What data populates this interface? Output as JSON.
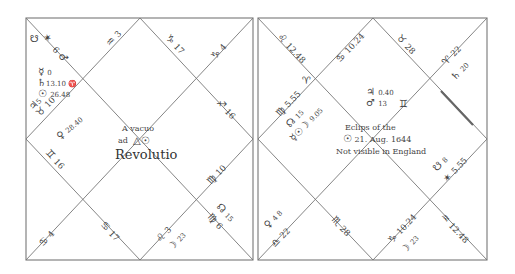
{
  "left_chart": {
    "caption": {
      "line1": "A vacuo",
      "line2": "ad",
      "title": "Revolutio"
    },
    "cusps": [
      {
        "sign": "♒",
        "degree": "3"
      },
      {
        "sign": "♑",
        "degree": "17"
      },
      {
        "sign": "♑",
        "degree": "4"
      },
      {
        "sign": "♐",
        "degree": "16"
      },
      {
        "sign": "♍",
        "degree": "10"
      },
      {
        "sign": "♍",
        "degree": "6"
      },
      {
        "sign": "♌",
        "degree": "3"
      },
      {
        "sign": "♋",
        "degree": "17"
      },
      {
        "sign": "♋",
        "degree": "4"
      },
      {
        "sign": "♊",
        "degree": "16"
      },
      {
        "sign": "♉",
        "degree": "10"
      },
      {
        "sign": "♂",
        "degree": "6"
      }
    ],
    "planets": [
      {
        "glyph": "☋",
        "label": ""
      },
      {
        "glyph": "✶",
        "label": ""
      },
      {
        "glyph": "☿",
        "label": "0"
      },
      {
        "glyph": "♄",
        "label": "13.10 ♈"
      },
      {
        "glyph": "☉",
        "label": "26.48"
      },
      {
        "glyph": "♃",
        "label": "5"
      },
      {
        "glyph": "♀",
        "label": "28.40"
      },
      {
        "glyph": "☊",
        "label": "15"
      },
      {
        "glyph": "☽",
        "label": "23"
      }
    ]
  },
  "right_chart": {
    "caption": {
      "line1": "Eclips of the",
      "line2": "21. Aug. 1644",
      "line3": "Not visible in England"
    },
    "cusps": [
      {
        "sign": "♌",
        "degree": "12.48"
      },
      {
        "sign": "♋",
        "degree": "10.24"
      },
      {
        "sign": "♉",
        "degree": "28"
      },
      {
        "sign": "♈",
        "degree": "22"
      },
      {
        "sign": "♍",
        "degree": "5.55"
      },
      {
        "sign": "♒",
        "degree": "12.48"
      },
      {
        "sign": "♑",
        "degree": "10.24"
      },
      {
        "sign": "♏",
        "degree": "28"
      },
      {
        "sign": "♎",
        "degree": "22"
      },
      {
        "sign": "✶",
        "degree": "5.55"
      }
    ],
    "planets": [
      {
        "glyph": "♈",
        "label": ""
      },
      {
        "glyph": "♃",
        "label": "0.40"
      },
      {
        "glyph": "♂",
        "label": "13"
      },
      {
        "glyph": "♊",
        "label": ""
      },
      {
        "glyph": "♄",
        "label": "20"
      },
      {
        "glyph": "☊",
        "label": "15"
      },
      {
        "glyph": "☿☉☽",
        "label": "9.05"
      },
      {
        "glyph": "☋",
        "label": "8"
      },
      {
        "glyph": "♀",
        "label": "4 8"
      },
      {
        "glyph": "☽",
        "label": "23"
      }
    ]
  }
}
